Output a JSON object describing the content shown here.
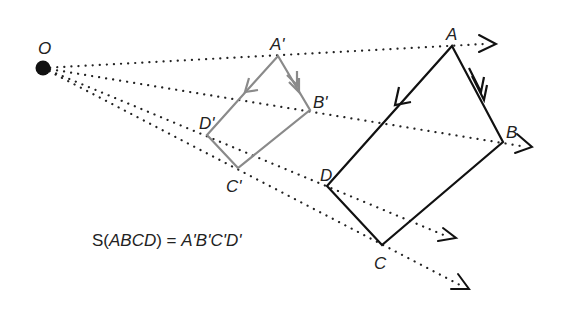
{
  "diagram": {
    "title": "",
    "center": {
      "label": "O",
      "x": 43,
      "y": 68
    },
    "original": {
      "color": "#111111",
      "vertices": [
        {
          "label": "A",
          "x": 452,
          "y": 46
        },
        {
          "label": "B",
          "x": 503,
          "y": 142
        },
        {
          "label": "C",
          "x": 382,
          "y": 245
        },
        {
          "label": "D",
          "x": 327,
          "y": 186
        }
      ]
    },
    "image": {
      "color": "#8a8a8a",
      "vertices": [
        {
          "label": "A'",
          "x": 278,
          "y": 56
        },
        {
          "label": "B'",
          "x": 310,
          "y": 110
        },
        {
          "label": "C'",
          "x": 238,
          "y": 168
        },
        {
          "label": "D'",
          "x": 207,
          "y": 135
        }
      ]
    },
    "rays": [
      {
        "through": "A",
        "end": [
          490,
          44
        ]
      },
      {
        "through": "B",
        "end": [
          528,
          147
        ]
      },
      {
        "through": "D",
        "end": [
          452,
          238
        ]
      },
      {
        "through": "C",
        "end": [
          466,
          287
        ]
      }
    ],
    "equation": {
      "prefix": "S(",
      "arg": "ABCD",
      "mid": ") = ",
      "result": "A'B'C'D'"
    }
  }
}
